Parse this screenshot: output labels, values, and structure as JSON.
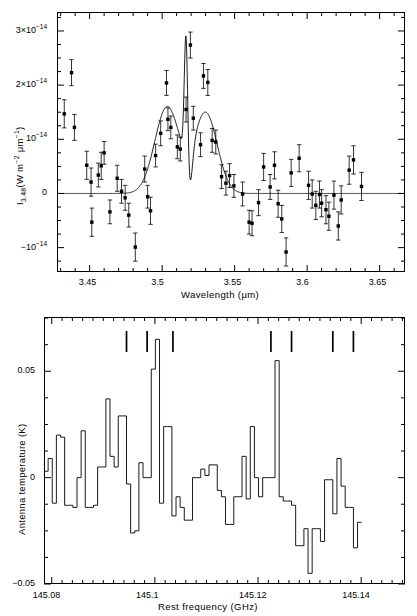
{
  "figure": {
    "panels": [
      "infrared-spectrum",
      "millimeter-spectrum"
    ]
  },
  "chart_data": [
    {
      "id": "top",
      "type": "scatter",
      "title": "",
      "xlabel": "Wavelength (μm)",
      "ylabel_parts": {
        "symbol": "I",
        "subscript": "3.48",
        "units": "(W m⁻² μm⁻¹)"
      },
      "ylabel": "I3.48(W m-2 um-1)",
      "xlim": [
        3.4275,
        3.6675
      ],
      "ylim": [
        -1.45e-14,
        3.35e-14
      ],
      "grid": false,
      "legend": "none",
      "xtick_labels": [
        "3.45",
        "3.5",
        "3.55",
        "3.6",
        "3.65"
      ],
      "xtick_values": [
        3.45,
        3.5,
        3.55,
        3.6,
        3.65
      ],
      "xminor_step": 0.01,
      "ytick_labels": [
        "3×10⁻¹⁴",
        "2×10⁻¹⁴",
        "10⁻¹⁴",
        "0",
        "−10⁻¹⁴"
      ],
      "ytick_values": [
        3e-14,
        2e-14,
        1e-14,
        0,
        -1e-14
      ],
      "yminor_step": 2.5e-15,
      "points": [
        {
          "x": 3.4325,
          "y": 1.47e-14,
          "e": 2.6e-15
        },
        {
          "x": 3.4375,
          "y": 2.23e-14,
          "e": 2.4e-15
        },
        {
          "x": 3.4395,
          "y": 1.22e-14,
          "e": 2.4e-15
        },
        {
          "x": 3.448,
          "y": 5.2e-15,
          "e": 2.6e-15
        },
        {
          "x": 3.451,
          "y": 2.1e-15,
          "e": 2.6e-15
        },
        {
          "x": 3.4515,
          "y": -5.3e-15,
          "e": 2.6e-15
        },
        {
          "x": 3.456,
          "y": 3.4e-15,
          "e": 2.2e-15
        },
        {
          "x": 3.458,
          "y": 5.1e-15,
          "e": 2.5e-15
        },
        {
          "x": 3.46,
          "y": 7.5e-15,
          "e": 2.1e-15
        },
        {
          "x": 3.464,
          "y": -3.4e-15,
          "e": 2.2e-15
        },
        {
          "x": 3.469,
          "y": 2.8e-15,
          "e": 2.4e-15
        },
        {
          "x": 3.472,
          "y": 4e-16,
          "e": 2.2e-15
        },
        {
          "x": 3.4745,
          "y": -8e-16,
          "e": 2.3e-15
        },
        {
          "x": 3.477,
          "y": -4e-15,
          "e": 2.2e-15
        },
        {
          "x": 3.4815,
          "y": -9.9e-15,
          "e": 2.6e-15
        },
        {
          "x": 3.488,
          "y": 4.5e-15,
          "e": 2.4e-15
        },
        {
          "x": 3.49,
          "y": -6e-16,
          "e": 2.1e-15
        },
        {
          "x": 3.492,
          "y": -3.2e-15,
          "e": 2.5e-15
        },
        {
          "x": 3.4955,
          "y": 7e-15,
          "e": 2.1e-15
        },
        {
          "x": 3.499,
          "y": 1.11e-14,
          "e": 2.3e-15
        },
        {
          "x": 3.503,
          "y": 2.04e-14,
          "e": 2.3e-15
        },
        {
          "x": 3.504,
          "y": 1.37e-14,
          "e": 2.1e-15
        },
        {
          "x": 3.506,
          "y": 1.22e-14,
          "e": 2.1e-15
        },
        {
          "x": 3.5105,
          "y": 8.6e-15,
          "e": 2.2e-15
        },
        {
          "x": 3.5125,
          "y": 8.2e-15,
          "e": 2.2e-15
        },
        {
          "x": 3.5165,
          "y": 1.55e-14,
          "e": 2.3e-15
        },
        {
          "x": 3.5195,
          "y": 2.74e-14,
          "e": 2.4e-15
        },
        {
          "x": 3.5215,
          "y": 1.39e-14,
          "e": 2.2e-15
        },
        {
          "x": 3.5265,
          "y": 9e-15,
          "e": 2.2e-15
        },
        {
          "x": 3.5285,
          "y": 2.17e-14,
          "e": 2.3e-15
        },
        {
          "x": 3.5315,
          "y": 2.05e-14,
          "e": 2.4e-15
        },
        {
          "x": 3.5345,
          "y": 9.8e-15,
          "e": 2.2e-15
        },
        {
          "x": 3.537,
          "y": 9.5e-15,
          "e": 2.2e-15
        },
        {
          "x": 3.541,
          "y": 3.1e-15,
          "e": 2.2e-15
        },
        {
          "x": 3.544,
          "y": 1.9e-15,
          "e": 2.2e-15
        },
        {
          "x": 3.5465,
          "y": 3.3e-15,
          "e": 2.2e-15
        },
        {
          "x": 3.5495,
          "y": 1.4e-15,
          "e": 2.1e-15
        },
        {
          "x": 3.5555,
          "y": -1e-16,
          "e": 2.2e-15
        },
        {
          "x": 3.56,
          "y": -5.3e-15,
          "e": 2.2e-15
        },
        {
          "x": 3.562,
          "y": -5.5e-15,
          "e": 2.3e-15
        },
        {
          "x": 3.5665,
          "y": -1.7e-15,
          "e": 2.4e-15
        },
        {
          "x": 3.57,
          "y": 4.9e-15,
          "e": 2.5e-15
        },
        {
          "x": 3.5745,
          "y": 1.2e-15,
          "e": 2.3e-15
        },
        {
          "x": 3.5775,
          "y": 5.2e-15,
          "e": 2.5e-15
        },
        {
          "x": 3.58,
          "y": -1.9e-15,
          "e": 2.5e-15
        },
        {
          "x": 3.5825,
          "y": -4.7e-15,
          "e": 2.5e-15
        },
        {
          "x": 3.5855,
          "y": -1.08e-14,
          "e": 2.6e-15
        },
        {
          "x": 3.589,
          "y": 3.8e-15,
          "e": 2.5e-15
        },
        {
          "x": 3.5945,
          "y": 6.5e-15,
          "e": 2.5e-15
        },
        {
          "x": 3.601,
          "y": 1.5e-15,
          "e": 2.6e-15
        },
        {
          "x": 3.6035,
          "y": -1e-16,
          "e": 2.6e-15
        },
        {
          "x": 3.606,
          "y": -2.2e-15,
          "e": 2.6e-15
        },
        {
          "x": 3.6085,
          "y": -2e-16,
          "e": 2.5e-15
        },
        {
          "x": 3.61,
          "y": -1.8e-15,
          "e": 2.5e-15
        },
        {
          "x": 3.613,
          "y": -3e-15,
          "e": 2.6e-15
        },
        {
          "x": 3.615,
          "y": -4.2e-15,
          "e": 2.6e-15
        },
        {
          "x": 3.6185,
          "y": -3e-16,
          "e": 2.6e-15
        },
        {
          "x": 3.6215,
          "y": -6e-15,
          "e": 2.6e-15
        },
        {
          "x": 3.6235,
          "y": -1.2e-15,
          "e": 2.6e-15
        },
        {
          "x": 3.629,
          "y": 4.3e-15,
          "e": 2.6e-15
        },
        {
          "x": 3.632,
          "y": 6.2e-15,
          "e": 2.6e-15
        },
        {
          "x": 3.6375,
          "y": 1.3e-15,
          "e": 2.6e-15
        }
      ],
      "fit_curve": {
        "description": "model fit: broad double-peaked profile with a narrow central emission spike",
        "components": [
          {
            "center": 3.5035,
            "amplitude": 1.6e-14,
            "width": 0.0085,
            "kind": "broad-peak"
          },
          {
            "center": 3.53,
            "amplitude": 1.49e-14,
            "width": 0.008,
            "kind": "broad-peak"
          },
          {
            "center": 3.5165,
            "amplitude": 2.6e-14,
            "width": 0.0012,
            "kind": "narrow-spike"
          },
          {
            "center": 3.5185,
            "amplitude": -8.5e-15,
            "width": 0.0022,
            "kind": "dip"
          }
        ]
      }
    },
    {
      "id": "bottom",
      "type": "line",
      "title": "",
      "xlabel": "Rest frequency (GHz)",
      "ylabel": "Antenna temperature (K)",
      "xlim": [
        145.0785,
        145.1485
      ],
      "ylim": [
        -0.05,
        0.0755
      ],
      "grid": false,
      "legend": "none",
      "drawstyle": "steps",
      "xtick_labels": [
        "145.08",
        "145.1",
        "145.12",
        "145.14"
      ],
      "xtick_values": [
        145.08,
        145.1,
        145.12,
        145.14
      ],
      "xminor_step": 0.002,
      "ytick_labels": [
        "0.05",
        "0",
        "−0.05"
      ],
      "ytick_values": [
        0.05,
        0,
        -0.05
      ],
      "yminor_step": 0.0125,
      "channel_width": 0.0008,
      "x_start": 145.0785,
      "values": [
        0.003,
        0.009,
        -0.012,
        0.02,
        0.019,
        -0.013,
        -0.013,
        -0.014,
        0.0,
        0.022,
        -0.014,
        -0.014,
        -0.013,
        0.005,
        0.005,
        0.037,
        0.01,
        0.005,
        0.029,
        0.029,
        -0.003,
        -0.026,
        -0.025,
        0.007,
        0.0,
        0.0,
        0.051,
        0.065,
        -0.012,
        0.024,
        0.024,
        -0.018,
        -0.009,
        -0.014,
        -0.02,
        -0.02,
        0.0,
        0.0,
        0.004,
        0.001,
        0.006,
        0.006,
        -0.006,
        -0.009,
        -0.022,
        -0.022,
        -0.009,
        -0.009,
        0.01,
        -0.01,
        0.024,
        0.0,
        -0.009,
        0.0,
        0.0,
        0.0,
        0.055,
        -0.009,
        -0.011,
        -0.011,
        -0.013,
        -0.032,
        -0.032,
        -0.024,
        -0.045,
        -0.024,
        -0.024,
        -0.03,
        -0.001,
        -0.001,
        -0.017,
        0.009,
        -0.004,
        -0.014,
        -0.014,
        -0.033,
        -0.021
      ],
      "line_markers": {
        "description": "transition frequency indicators above spectrum",
        "frequencies": [
          145.0945,
          145.0985,
          145.1035,
          145.1225,
          145.1265,
          145.1345,
          145.1385
        ]
      }
    }
  ]
}
